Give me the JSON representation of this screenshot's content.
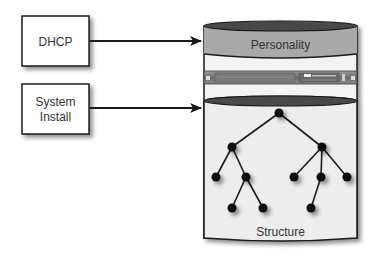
{
  "diagram": {
    "sources": [
      {
        "id": "dhcp",
        "label_lines": [
          "DHCP"
        ]
      },
      {
        "id": "system-install",
        "label_lines": [
          "System",
          "Install"
        ]
      }
    ],
    "cylinder": {
      "top_section": {
        "label": "Personality",
        "fill": "#a8a8a8"
      },
      "middle_section": {
        "label": "",
        "content": "rack-server-image"
      },
      "bottom_section": {
        "label": "Structure",
        "fill": "#ececec"
      }
    },
    "edges": [
      {
        "from": "dhcp",
        "to": "personality"
      },
      {
        "from": "system-install",
        "to": "structure"
      }
    ],
    "tree": {
      "nodes": [
        {
          "id": "root",
          "x": 279,
          "y": 113
        },
        {
          "id": "l",
          "x": 232,
          "y": 147
        },
        {
          "id": "r",
          "x": 322,
          "y": 147
        },
        {
          "id": "ll",
          "x": 216,
          "y": 177
        },
        {
          "id": "lr",
          "x": 246,
          "y": 177
        },
        {
          "id": "lrl",
          "x": 232,
          "y": 208
        },
        {
          "id": "lrr",
          "x": 263,
          "y": 208
        },
        {
          "id": "rl",
          "x": 294,
          "y": 177
        },
        {
          "id": "rm",
          "x": 321,
          "y": 177
        },
        {
          "id": "rr",
          "x": 347,
          "y": 177
        },
        {
          "id": "rml",
          "x": 311,
          "y": 208
        }
      ],
      "links": [
        [
          "root",
          "l"
        ],
        [
          "root",
          "r"
        ],
        [
          "l",
          "ll"
        ],
        [
          "l",
          "lr"
        ],
        [
          "lr",
          "lrl"
        ],
        [
          "lr",
          "lrr"
        ],
        [
          "r",
          "rl"
        ],
        [
          "r",
          "rm"
        ],
        [
          "r",
          "rr"
        ],
        [
          "rm",
          "rml"
        ]
      ]
    },
    "colors": {
      "stroke": "#1a1a1a",
      "box_fill": "#ffffff",
      "ellipse_dark": "#4a4a4a",
      "personality_fill": "#a9a9a9",
      "structure_fill": "#ededed",
      "node_fill": "#111111"
    }
  }
}
